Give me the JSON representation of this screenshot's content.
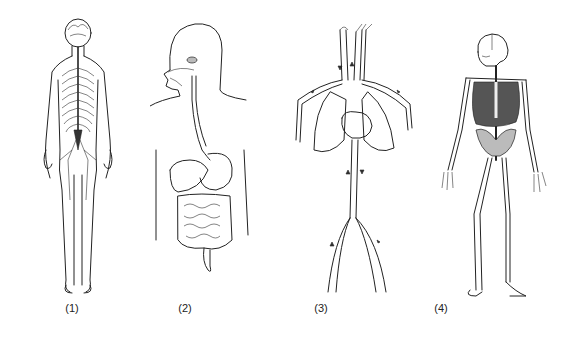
{
  "figure": {
    "panels": [
      {
        "id": 1,
        "label": "(1)",
        "subject": "nervous-system",
        "label_x": 72
      },
      {
        "id": 2,
        "label": "(2)",
        "subject": "digestive-system",
        "label_x": 185
      },
      {
        "id": 3,
        "label": "(3)",
        "subject": "circulatory-system",
        "label_x": 321
      },
      {
        "id": 4,
        "label": "(4)",
        "subject": "skeletal-system",
        "label_x": 441
      }
    ]
  }
}
